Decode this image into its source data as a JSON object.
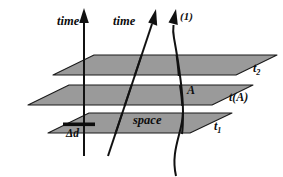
{
  "figure": {
    "background_color": "#ffffff",
    "plane_fill_color": "#9a9a9a",
    "plane_edge_color": "#1a1a1a",
    "line_color": "#111111",
    "text_color": "#0d0d0d"
  },
  "labels": {
    "time_left": "time",
    "time_middle": "time",
    "branch_one": "(1)",
    "space": "space",
    "event_A": "A",
    "plane_top": "t",
    "plane_top_sub": "2",
    "plane_middle": "t(A)",
    "plane_bottom": "t",
    "plane_bottom_sub": "1",
    "delta_d": "Δd"
  },
  "elements": {
    "planes": [
      {
        "name": "plane-t2",
        "label": "t",
        "subscript": "2"
      },
      {
        "name": "plane-tA",
        "label": "t(A)",
        "subscript": ""
      },
      {
        "name": "plane-t1",
        "label": "t",
        "subscript": "1"
      }
    ],
    "worldlines": [
      {
        "name": "worldline-1",
        "arrow_label": "time",
        "orientation": "vertical"
      },
      {
        "name": "worldline-2",
        "arrow_label": "time",
        "orientation": "slanted"
      },
      {
        "name": "worldline-3",
        "arrow_label": "(1)",
        "orientation": "curved"
      }
    ],
    "scale_bar": {
      "name": "delta-d-scale-bar",
      "label": "Δd"
    }
  }
}
